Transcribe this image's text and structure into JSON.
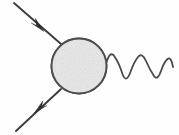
{
  "figure": {
    "title": "Feynman diagram: fermion-photon vertex with blob",
    "background_color": "#fefefe",
    "width": 179,
    "height": 135
  },
  "blob": {
    "label": "interaction-blob",
    "shape": "circle",
    "center_x": 79,
    "center_y": 66,
    "radius": 27.5,
    "fill_color": "#e9e9e9",
    "stroke_color": "#4d4d4d",
    "texture": "speckled-gray"
  },
  "lines": [
    {
      "name": "incoming-fermion",
      "type": "fermion",
      "direction": "into-blob",
      "from_x": 14,
      "from_y": 3,
      "to_x": 60,
      "to_y": 44,
      "stroke_color": "#3c3c3c",
      "arrow": {
        "x": 37,
        "y": 24,
        "angle_deg": 41,
        "points_toward": "blob"
      }
    },
    {
      "name": "outgoing-fermion",
      "type": "fermion",
      "direction": "out-of-blob",
      "from_x": 61,
      "from_y": 89,
      "to_x": 16,
      "to_y": 131,
      "stroke_color": "#3c3c3c",
      "arrow": {
        "x": 41,
        "y": 107,
        "angle_deg": 223,
        "points_toward": "away-from-blob"
      }
    },
    {
      "name": "photon-wave",
      "type": "photon",
      "direction": "out-of-blob",
      "from_x": 106,
      "from_y": 62,
      "to_x": 173,
      "to_y": 67,
      "stroke_color": "#4a4a4a",
      "cycles": 4,
      "amplitude": 11,
      "wavelength": 17
    }
  ],
  "annotations": {
    "path_incoming": "M 14 3 L 61 44",
    "path_outgoing": "M 61 89 L 16 131",
    "path_photon": "M 106.5 62.5 Q 110 50 114.5 56.5 Q 119 63 122.5 74 Q 126 84 130.5 72 Q 134 62 138 57 Q 142 52 146 61 Q 150 70 154 76 Q 157.5 81 161 71 Q 164 62 167.5 59 Q 171 56 173 67",
    "arrow_incoming_points": "30.5,17 43.5,31.5 36.5,25.5 33.5,30",
    "arrow_outgoing_points": "48.5,99.5 34.5,113.5 42,107.5 45.5,103"
  }
}
